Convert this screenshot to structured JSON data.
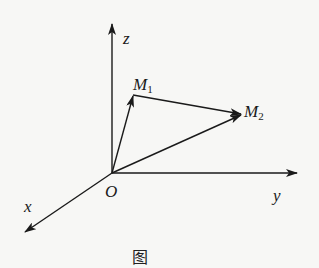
{
  "figure": {
    "type": "3d-coordinate-vector-diagram",
    "colors": {
      "stroke": "#1a1a1a",
      "background": "#f7f7f5"
    },
    "origin": {
      "label": "O",
      "x": 112,
      "y": 173
    },
    "axes": [
      {
        "name": "z",
        "label": "z",
        "end": {
          "x": 112,
          "y": 24
        }
      },
      {
        "name": "y",
        "label": "y",
        "end": {
          "x": 297,
          "y": 173
        }
      },
      {
        "name": "x",
        "label": "x",
        "end": {
          "x": 25,
          "y": 232
        }
      }
    ],
    "points": [
      {
        "name": "M1",
        "base": "M",
        "sub": "1",
        "x": 133,
        "y": 95
      },
      {
        "name": "M2",
        "base": "M",
        "sub": "2",
        "x": 242,
        "y": 115
      }
    ],
    "vectors": [
      {
        "from": "O",
        "to": "M1"
      },
      {
        "from": "M1",
        "to": "M2"
      },
      {
        "from": "O",
        "to": "M2"
      }
    ],
    "caption": "图"
  }
}
